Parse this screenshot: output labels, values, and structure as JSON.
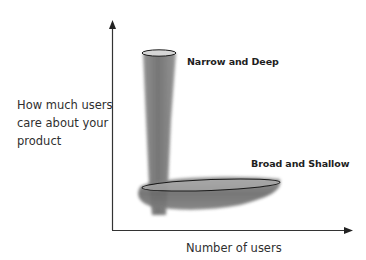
{
  "diagram": {
    "y_axis_label_lines": [
      "How much users",
      "care about your",
      "product"
    ],
    "x_axis_label": "Number of users",
    "annotations": {
      "narrow": "Narrow and Deep",
      "broad": "Broad and Shallow"
    },
    "colors": {
      "axis": "#333333",
      "blob": "#6f6f6f",
      "ellipse_stroke": "#1a1a1a",
      "background": "#ffffff"
    }
  }
}
